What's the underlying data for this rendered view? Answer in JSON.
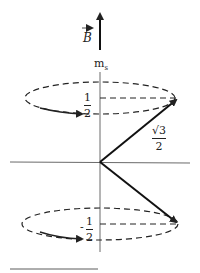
{
  "diagram": {
    "field_label": "B",
    "axis_label": "m",
    "axis_subscript": "s",
    "upper_value": {
      "numerator": "1",
      "denominator": "2"
    },
    "lower_value": {
      "sign": "-",
      "numerator": "1",
      "denominator": "2"
    },
    "spin_magnitude": {
      "numerator": "√3",
      "denominator": "2"
    },
    "colors": {
      "ink": "#222222",
      "background": "#ffffff"
    }
  }
}
